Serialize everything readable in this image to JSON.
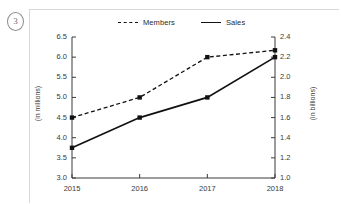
{
  "item": {
    "number": "3"
  },
  "chart_data": {
    "type": "line",
    "title": "",
    "xlabel": "",
    "categories": [
      "2015",
      "2016",
      "2017",
      "2018"
    ],
    "x": [
      2015,
      2016,
      2017,
      2018
    ],
    "grid": false,
    "legend_position": "top",
    "series": [
      {
        "name": "Members",
        "axis": "left",
        "unit_label": "(in millions)",
        "linestyle": "dashed",
        "marker": "square",
        "color": "#111111",
        "values": [
          4.5,
          5.0,
          6.0,
          6.17
        ]
      },
      {
        "name": "Sales",
        "axis": "right",
        "unit_label": "(in billions)",
        "linestyle": "solid",
        "marker": "square",
        "color": "#111111",
        "values": [
          3.75,
          4.5,
          5.0,
          6.0
        ],
        "right_axis_values": [
          1.3,
          1.6,
          1.8,
          2.2
        ]
      }
    ],
    "left_axis": {
      "label": "(in millions)",
      "ylim": [
        3.0,
        6.5
      ],
      "ticks": [
        "3.0",
        "3.5",
        "4.0",
        "4.5",
        "5.0",
        "5.5",
        "6.0",
        "6.5"
      ],
      "tick_values": [
        3.0,
        3.5,
        4.0,
        4.5,
        5.0,
        5.5,
        6.0,
        6.5
      ]
    },
    "right_axis": {
      "label": "(in billions)",
      "ylim": [
        1.0,
        2.4
      ],
      "ticks": [
        "1.0",
        "1.2",
        "1.4",
        "1.6",
        "1.8",
        "2.0",
        "2.2",
        "2.4"
      ],
      "tick_values": [
        1.0,
        1.2,
        1.4,
        1.6,
        1.8,
        2.0,
        2.2,
        2.4
      ]
    },
    "legend": [
      {
        "label": "Members",
        "style": "dashed"
      },
      {
        "label": "Sales",
        "style": "solid"
      }
    ]
  }
}
